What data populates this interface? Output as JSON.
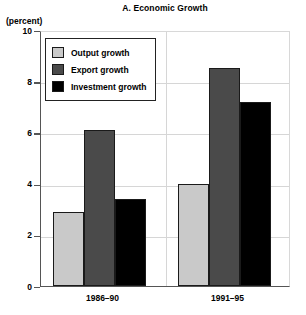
{
  "chart_data": {
    "type": "bar",
    "title": "A. Economic Growth",
    "ylabel": "(percent)",
    "xlabel": "",
    "ylim": [
      0,
      10
    ],
    "yticks": [
      0,
      2,
      4,
      6,
      8,
      10
    ],
    "grid": true,
    "legend_position": "top-left",
    "categories": [
      "1986–90",
      "1991–95"
    ],
    "series": [
      {
        "name": "Output growth",
        "values": [
          2.9,
          4.0
        ],
        "color": "#c9c9c9"
      },
      {
        "name": "Export growth",
        "values": [
          6.1,
          8.5
        ],
        "color": "#4a4a4a"
      },
      {
        "name": "Investment growth",
        "values": [
          3.4,
          7.2
        ],
        "color": "#000000"
      }
    ]
  },
  "axis": {
    "unit_label": "(percent)",
    "tick_labels": [
      "0",
      "2",
      "4",
      "6",
      "8",
      "10"
    ]
  },
  "legend": {
    "items": [
      {
        "label": "Output growth"
      },
      {
        "label": "Export growth"
      },
      {
        "label": "Investment growth"
      }
    ]
  }
}
